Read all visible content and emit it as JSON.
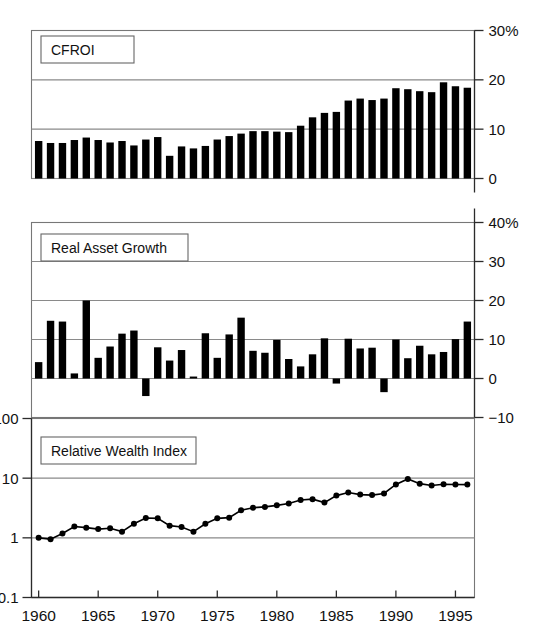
{
  "figure": {
    "background": "#ffffff",
    "ink": "#000000",
    "grid_color": "#8a8a8a",
    "x_axis": {
      "label": "",
      "ticks": [
        "1960",
        "1965",
        "1970",
        "1975",
        "1980",
        "1985",
        "1990",
        "1995"
      ],
      "tick_values": [
        1960,
        1965,
        1970,
        1975,
        1980,
        1985,
        1990,
        1995
      ],
      "range": [
        1959.4,
        1996.6
      ]
    }
  },
  "chart_data": [
    {
      "type": "bar",
      "title": "CFROI",
      "panel": "top",
      "xlabel": "",
      "ylabel": "",
      "ylim": [
        0,
        30
      ],
      "yticks": [
        0,
        10,
        20,
        30
      ],
      "ytick_labels": [
        "0",
        "10",
        "20",
        "30%"
      ],
      "grid": true,
      "legend": "none",
      "units": "percent",
      "x": [
        1960,
        1961,
        1962,
        1963,
        1964,
        1965,
        1966,
        1967,
        1968,
        1969,
        1970,
        1971,
        1972,
        1973,
        1974,
        1975,
        1976,
        1977,
        1978,
        1979,
        1980,
        1981,
        1982,
        1983,
        1984,
        1985,
        1986,
        1987,
        1988,
        1989,
        1990,
        1991,
        1992,
        1993,
        1994,
        1995,
        1996
      ],
      "categories": [
        "1960",
        "1961",
        "1962",
        "1963",
        "1964",
        "1965",
        "1966",
        "1967",
        "1968",
        "1969",
        "1970",
        "1971",
        "1972",
        "1973",
        "1974",
        "1975",
        "1976",
        "1977",
        "1978",
        "1979",
        "1980",
        "1981",
        "1982",
        "1983",
        "1984",
        "1985",
        "1986",
        "1987",
        "1988",
        "1989",
        "1990",
        "1991",
        "1992",
        "1993",
        "1994",
        "1995",
        "1996"
      ],
      "values": [
        7.6,
        7.2,
        7.2,
        7.8,
        8.3,
        7.8,
        7.3,
        7.6,
        6.7,
        7.9,
        8.4,
        4.6,
        6.5,
        6.1,
        6.6,
        7.9,
        8.6,
        9.1,
        9.6,
        9.6,
        9.5,
        9.4,
        10.7,
        12.4,
        13.3,
        13.5,
        15.8,
        16.2,
        15.9,
        16.2,
        18.3,
        18.1,
        17.7,
        17.5,
        19.5,
        18.7,
        18.4,
        18.5
      ]
    },
    {
      "type": "bar",
      "title": "Real Asset Growth",
      "panel": "middle",
      "xlabel": "",
      "ylabel": "",
      "ylim": [
        -10,
        40
      ],
      "yticks": [
        -10,
        0,
        10,
        20,
        30,
        40
      ],
      "ytick_labels": [
        "−10",
        "0",
        "10",
        "20",
        "30",
        "40%"
      ],
      "grid": true,
      "legend": "none",
      "units": "percent",
      "x": [
        1960,
        1961,
        1962,
        1963,
        1964,
        1965,
        1966,
        1967,
        1968,
        1969,
        1970,
        1971,
        1972,
        1973,
        1974,
        1975,
        1976,
        1977,
        1978,
        1979,
        1980,
        1981,
        1982,
        1983,
        1984,
        1985,
        1986,
        1987,
        1988,
        1989,
        1990,
        1991,
        1992,
        1993,
        1994,
        1995,
        1996
      ],
      "categories": [
        "1960",
        "1961",
        "1962",
        "1963",
        "1964",
        "1965",
        "1966",
        "1967",
        "1968",
        "1969",
        "1970",
        "1971",
        "1972",
        "1973",
        "1974",
        "1975",
        "1976",
        "1977",
        "1978",
        "1979",
        "1980",
        "1981",
        "1982",
        "1983",
        "1984",
        "1985",
        "1986",
        "1987",
        "1988",
        "1989",
        "1990",
        "1991",
        "1992",
        "1993",
        "1994",
        "1995",
        "1996"
      ],
      "values": [
        4.2,
        14.8,
        14.6,
        1.3,
        20.0,
        5.3,
        8.2,
        11.5,
        12.3,
        -4.5,
        8.0,
        4.6,
        7.3,
        0.5,
        11.6,
        5.3,
        11.3,
        15.6,
        7.1,
        6.6,
        9.9,
        5.0,
        3.1,
        6.2,
        10.3,
        -1.3,
        10.2,
        7.7,
        7.9,
        -3.5,
        10.0,
        5.2,
        8.4,
        6.2,
        6.8,
        10.1,
        14.6
      ]
    },
    {
      "type": "line",
      "title": "Relative Wealth Index",
      "panel": "bottom",
      "xlabel": "",
      "ylabel": "",
      "yscale": "log",
      "ylim": [
        0.1,
        100
      ],
      "yticks": [
        0.1,
        1,
        10,
        100
      ],
      "ytick_labels": [
        "0.1",
        "1",
        "10",
        "100"
      ],
      "grid": true,
      "legend": "none",
      "marker": "filled-circle",
      "x": [
        1960,
        1961,
        1962,
        1963,
        1964,
        1965,
        1966,
        1967,
        1968,
        1969,
        1970,
        1971,
        1972,
        1973,
        1974,
        1975,
        1976,
        1977,
        1978,
        1979,
        1980,
        1981,
        1982,
        1983,
        1984,
        1985,
        1986,
        1987,
        1988,
        1989,
        1990,
        1991,
        1992,
        1993,
        1994,
        1995,
        1996
      ],
      "values": [
        1.0,
        0.95,
        1.18,
        1.55,
        1.48,
        1.4,
        1.45,
        1.27,
        1.72,
        2.15,
        2.12,
        1.6,
        1.52,
        1.27,
        1.72,
        2.12,
        2.18,
        2.9,
        3.2,
        3.3,
        3.5,
        3.75,
        4.3,
        4.45,
        3.9,
        5.1,
        5.75,
        5.3,
        5.2,
        5.55,
        7.85,
        9.7,
        8.1,
        7.55,
        7.9,
        7.85,
        7.8
      ]
    }
  ]
}
